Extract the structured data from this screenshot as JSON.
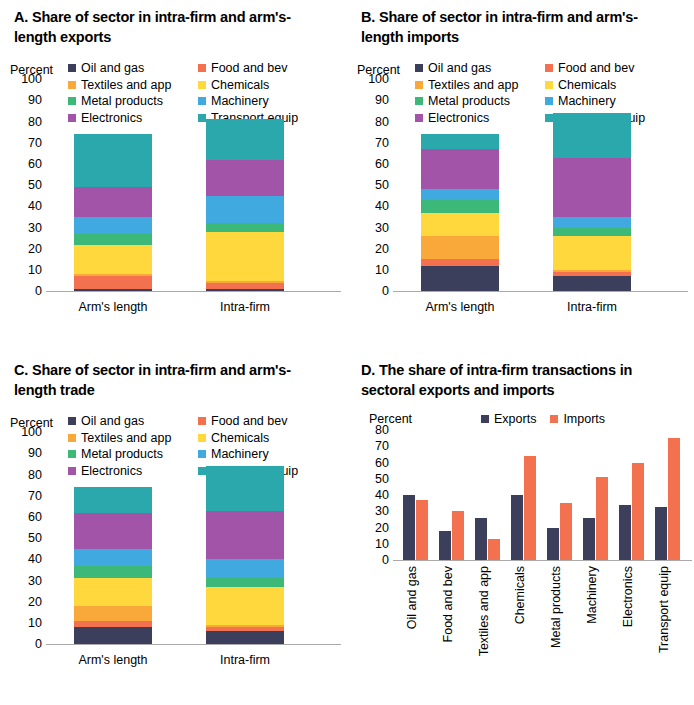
{
  "palette": {
    "oil_and_gas": "#3b3f5c",
    "food_and_bev": "#f4714f",
    "textiles_and_app": "#f9a93a",
    "chemicals": "#ffd83d",
    "metal_products": "#3cb878",
    "machinery": "#3fa9e0",
    "electronics": "#a254a8",
    "transport_equip": "#2ba8ab",
    "exports": "#3b3f5c",
    "imports": "#f4714f",
    "axis": "#aaaaaa"
  },
  "sector_legend": [
    {
      "label": "Oil and gas",
      "key": "oil_and_gas"
    },
    {
      "label": "Food and bev",
      "key": "food_and_bev"
    },
    {
      "label": "Textiles and app",
      "key": "textiles_and_app"
    },
    {
      "label": "Chemicals",
      "key": "chemicals"
    },
    {
      "label": "Metal products",
      "key": "metal_products"
    },
    {
      "label": "Machinery",
      "key": "machinery"
    },
    {
      "label": "Electronics",
      "key": "electronics"
    },
    {
      "label": "Transport equip",
      "key": "transport_equip"
    }
  ],
  "panels": {
    "a": {
      "title": "A. Share of sector in intra-firm and arm's-length exports"
    },
    "b": {
      "title": "B. Share of sector in intra-firm and arm's-length imports"
    },
    "c": {
      "title": "C. Share of sector in intra-firm and arm's-length trade"
    },
    "d": {
      "title": "D. The share of intra-firm transactions in sectoral exports and imports"
    }
  },
  "axis_label": "Percent",
  "chart_data": [
    {
      "id": "A",
      "type": "bar",
      "stacked": true,
      "title": "A. Share of sector in intra-firm and arm's-length exports",
      "xlabel": "",
      "ylabel": "Percent",
      "ylim": [
        0,
        100
      ],
      "yticks": [
        0,
        10,
        20,
        30,
        40,
        50,
        60,
        70,
        80,
        90,
        100
      ],
      "grid": false,
      "legend_position": "top",
      "categories": [
        "Arm's length",
        "Intra-firm"
      ],
      "series": [
        {
          "name": "Oil and gas",
          "values": [
            1,
            1
          ]
        },
        {
          "name": "Food and bev",
          "values": [
            6,
            3
          ]
        },
        {
          "name": "Textiles and app",
          "values": [
            1,
            1
          ]
        },
        {
          "name": "Chemicals",
          "values": [
            14,
            23
          ]
        },
        {
          "name": "Metal products",
          "values": [
            5,
            4
          ]
        },
        {
          "name": "Machinery",
          "values": [
            8,
            13
          ]
        },
        {
          "name": "Electronics",
          "values": [
            14,
            17
          ]
        },
        {
          "name": "Transport equip",
          "values": [
            25,
            19
          ]
        }
      ],
      "totals": [
        74,
        81
      ]
    },
    {
      "id": "B",
      "type": "bar",
      "stacked": true,
      "title": "B. Share of sector in intra-firm and arm's-length imports",
      "xlabel": "",
      "ylabel": "Percent",
      "ylim": [
        0,
        100
      ],
      "yticks": [
        0,
        10,
        20,
        30,
        40,
        50,
        60,
        70,
        80,
        90,
        100
      ],
      "grid": false,
      "legend_position": "top",
      "categories": [
        "Arm's length",
        "Intra-firm"
      ],
      "series": [
        {
          "name": "Oil and gas",
          "values": [
            12,
            7
          ]
        },
        {
          "name": "Food and bev",
          "values": [
            3,
            2
          ]
        },
        {
          "name": "Textiles and app",
          "values": [
            11,
            1
          ]
        },
        {
          "name": "Chemicals",
          "values": [
            11,
            16
          ]
        },
        {
          "name": "Metal products",
          "values": [
            6,
            4
          ]
        },
        {
          "name": "Machinery",
          "values": [
            5,
            5
          ]
        },
        {
          "name": "Electronics",
          "values": [
            19,
            28
          ]
        },
        {
          "name": "Transport equip",
          "values": [
            7,
            21
          ]
        }
      ],
      "totals": [
        74,
        84
      ]
    },
    {
      "id": "C",
      "type": "bar",
      "stacked": true,
      "title": "C. Share of sector in intra-firm and arm's-length trade",
      "xlabel": "",
      "ylabel": "Percent",
      "ylim": [
        0,
        100
      ],
      "yticks": [
        0,
        10,
        20,
        30,
        40,
        50,
        60,
        70,
        80,
        90,
        100
      ],
      "grid": false,
      "legend_position": "top",
      "categories": [
        "Arm's length",
        "Intra-firm"
      ],
      "series": [
        {
          "name": "Oil and gas",
          "values": [
            8,
            6
          ]
        },
        {
          "name": "Food and bev",
          "values": [
            3,
            2
          ]
        },
        {
          "name": "Textiles and app",
          "values": [
            7,
            1
          ]
        },
        {
          "name": "Chemicals",
          "values": [
            13,
            18
          ]
        },
        {
          "name": "Metal products",
          "values": [
            6,
            4
          ]
        },
        {
          "name": "Machinery",
          "values": [
            8,
            9
          ]
        },
        {
          "name": "Electronics",
          "values": [
            17,
            23
          ]
        },
        {
          "name": "Transport equip",
          "values": [
            12,
            21
          ]
        }
      ],
      "totals": [
        74,
        84
      ]
    },
    {
      "id": "D",
      "type": "bar",
      "stacked": false,
      "title": "D. The share of intra-firm transactions in sectoral exports and imports",
      "xlabel": "",
      "ylabel": "Percent",
      "ylim": [
        0,
        80
      ],
      "yticks": [
        0,
        10,
        20,
        30,
        40,
        50,
        60,
        70,
        80
      ],
      "grid": false,
      "legend_position": "top",
      "categories": [
        "Oil and gas",
        "Food and bev",
        "Textiles and app",
        "Chemicals",
        "Metal products",
        "Machinery",
        "Electronics",
        "Transport equip"
      ],
      "series": [
        {
          "name": "Exports",
          "values": [
            40,
            18,
            26,
            40,
            20,
            26,
            34,
            33
          ]
        },
        {
          "name": "Imports",
          "values": [
            37,
            30,
            13,
            64,
            35,
            51,
            60,
            75
          ]
        }
      ]
    }
  ]
}
